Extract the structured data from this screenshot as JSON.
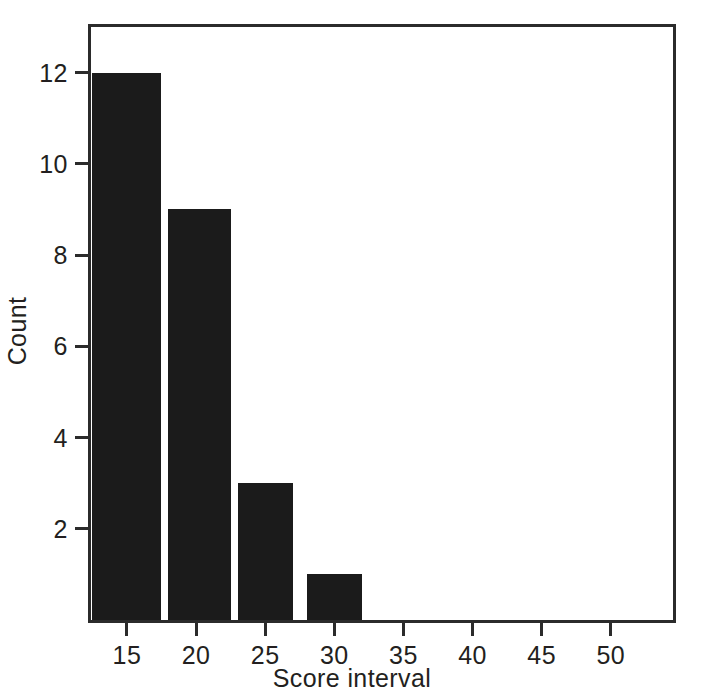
{
  "chart_data": {
    "type": "bar",
    "title": "",
    "subtitle": "",
    "xlabel": "Score interval",
    "ylabel": "Count",
    "categories": [
      "15",
      "20",
      "25",
      "30",
      "35",
      "40",
      "45",
      "50"
    ],
    "bins": [
      {
        "label": "15",
        "left": 12.5,
        "right": 17.5,
        "value": 12
      },
      {
        "label": "20",
        "left": 18.0,
        "right": 22.5,
        "value": 9
      },
      {
        "label": "25",
        "left": 23.0,
        "right": 27.0,
        "value": 3
      },
      {
        "label": "30",
        "left": 28.0,
        "right": 32.0,
        "value": 1
      },
      {
        "label": "35",
        "left": 33.0,
        "right": 37.0,
        "value": 0
      },
      {
        "label": "40",
        "left": 38.0,
        "right": 42.0,
        "value": 0
      },
      {
        "label": "45",
        "left": 43.0,
        "right": 47.0,
        "value": 0
      },
      {
        "label": "50",
        "left": 48.0,
        "right": 52.0,
        "value": 0
      }
    ],
    "values": [
      12,
      9,
      3,
      1,
      0,
      0,
      0,
      0
    ],
    "xticks": [
      "15",
      "20",
      "25",
      "30",
      "35",
      "40",
      "45",
      "50"
    ],
    "xtick_values": [
      15,
      20,
      25,
      30,
      35,
      40,
      45,
      50
    ],
    "yticks": [
      "2",
      "4",
      "6",
      "8",
      "10",
      "12"
    ],
    "ytick_values": [
      2,
      4,
      6,
      8,
      10,
      12
    ],
    "xlim": [
      12.4,
      54.5
    ],
    "ylim": [
      0,
      13.0
    ],
    "grid": false,
    "legend": false,
    "legend_position": "none",
    "bar_color": "#1b1b1b",
    "axis_color": "#2b2b2b",
    "background_color": "#ffffff",
    "text_color": "#231f20"
  }
}
